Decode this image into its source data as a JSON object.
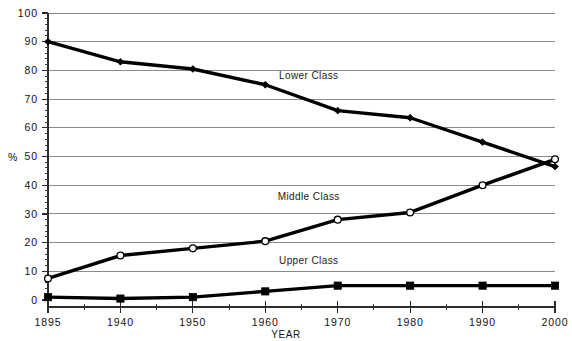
{
  "chart_data": {
    "type": "line",
    "title": "",
    "xlabel": "YEAR",
    "ylabel": "%",
    "x": [
      1895,
      1940,
      1950,
      1960,
      1970,
      1980,
      1990,
      2000
    ],
    "xtick_labels": [
      "1895",
      "1940",
      "1950",
      "1960",
      "1970",
      "1980",
      "1990",
      "2000"
    ],
    "ytick_labels": [
      "0",
      "10",
      "20",
      "30",
      "40",
      "50",
      "60",
      "70",
      "80",
      "90",
      "100"
    ],
    "ytick_values": [
      0,
      10,
      20,
      30,
      40,
      50,
      60,
      70,
      80,
      90,
      100
    ],
    "ylim": [
      0,
      100
    ],
    "grid": "horizontal",
    "legend_position": "inline-annotations",
    "minor_ticks_y": 2,
    "series": [
      {
        "name": "Lower Class",
        "marker": "filled-diamond",
        "values": [
          90,
          83,
          80.5,
          75,
          66,
          63.5,
          55,
          46.5
        ],
        "annotation": "Lower Class",
        "annotation_x": 1966,
        "annotation_y": 77
      },
      {
        "name": "Middle Class",
        "marker": "open-circle",
        "values": [
          7.5,
          15.5,
          18,
          20.5,
          28,
          30.5,
          40,
          49
        ],
        "annotation": "Middle Class",
        "annotation_x": 1966,
        "annotation_y": 35
      },
      {
        "name": "Upper Class",
        "marker": "filled-square",
        "values": [
          1,
          0.5,
          1,
          3,
          5,
          5,
          5,
          5
        ],
        "annotation": "Upper Class",
        "annotation_x": 1966,
        "annotation_y": 12.5
      }
    ],
    "colors": {
      "line": "#000000",
      "grid": "#8a8a8a",
      "axis": "#2b2b2b",
      "background": "#ffffff",
      "text": "#111111"
    }
  }
}
